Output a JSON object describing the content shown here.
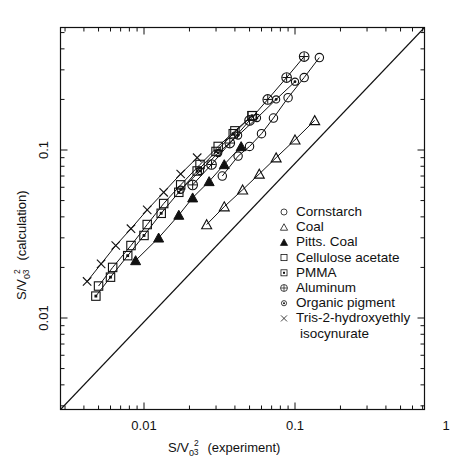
{
  "chart_data": {
    "type": "scatter",
    "title": "",
    "xlabel": "S/V0^2/3  (experiment)",
    "ylabel": "S/V0^2/3  (calculation)",
    "xlabel_parts": {
      "prefix": "S/V",
      "sub": "0",
      "sup_num": "2",
      "sup_den": "3",
      "suffix": "(experiment)"
    },
    "ylabel_parts": {
      "prefix": "S/V",
      "sub": "0",
      "sup_num": "2",
      "sup_den": "3",
      "suffix": "(calculation)"
    },
    "xscale": "log",
    "yscale": "log",
    "xlim": [
      0.003,
      1.0
    ],
    "ylim": [
      0.003,
      1.0
    ],
    "grid": false,
    "legend_position": "center-right",
    "xtick_labels": [
      {
        "value": 0.01,
        "label": "0.01"
      },
      {
        "value": 0.1,
        "label": "0.1"
      },
      {
        "value": 1,
        "label": "1"
      }
    ],
    "ytick_labels": [
      {
        "value": 0.01,
        "label": "0.01"
      },
      {
        "value": 0.1,
        "label": "0.1"
      },
      {
        "value": 1,
        "label": "1"
      }
    ],
    "reference_line": {
      "name": "one-to-one-line",
      "from": [
        0.003,
        0.003
      ],
      "to": [
        1.0,
        1.0
      ]
    },
    "series": [
      {
        "name": "Cornstarch",
        "marker": "open-circle",
        "points": [
          [
            0.033,
            0.07
          ],
          [
            0.042,
            0.092
          ],
          [
            0.05,
            0.105
          ],
          [
            0.06,
            0.125
          ],
          [
            0.072,
            0.155
          ],
          [
            0.09,
            0.205
          ],
          [
            0.115,
            0.27
          ],
          [
            0.145,
            0.355
          ]
        ]
      },
      {
        "name": "Coal",
        "marker": "open-triangle",
        "points": [
          [
            0.026,
            0.036
          ],
          [
            0.034,
            0.046
          ],
          [
            0.045,
            0.058
          ],
          [
            0.058,
            0.072
          ],
          [
            0.075,
            0.09
          ],
          [
            0.1,
            0.115
          ],
          [
            0.135,
            0.15
          ]
        ]
      },
      {
        "name": "Pitts. Coal",
        "marker": "filled-triangle",
        "points": [
          [
            0.0088,
            0.022
          ],
          [
            0.0125,
            0.03
          ],
          [
            0.017,
            0.041
          ],
          [
            0.021,
            0.052
          ],
          [
            0.027,
            0.065
          ],
          [
            0.034,
            0.082
          ],
          [
            0.044,
            0.105
          ]
        ]
      },
      {
        "name": "Cellulose acetate",
        "marker": "open-square",
        "points": [
          [
            0.005,
            0.0155
          ],
          [
            0.0062,
            0.02
          ],
          [
            0.0082,
            0.027
          ],
          [
            0.0105,
            0.036
          ],
          [
            0.0135,
            0.048
          ],
          [
            0.0175,
            0.062
          ],
          [
            0.0235,
            0.082
          ],
          [
            0.031,
            0.105
          ],
          [
            0.04,
            0.13
          ],
          [
            0.052,
            0.16
          ]
        ]
      },
      {
        "name": "PMMA",
        "marker": "dotted-square",
        "points": [
          [
            0.0048,
            0.0135
          ],
          [
            0.006,
            0.0175
          ],
          [
            0.0078,
            0.0235
          ],
          [
            0.01,
            0.031
          ],
          [
            0.013,
            0.042
          ],
          [
            0.017,
            0.056
          ],
          [
            0.0225,
            0.075
          ],
          [
            0.03,
            0.098
          ],
          [
            0.039,
            0.125
          ],
          [
            0.052,
            0.16
          ]
        ]
      },
      {
        "name": "Aluminum",
        "marker": "crossed-circle",
        "points": [
          [
            0.021,
            0.062
          ],
          [
            0.028,
            0.082
          ],
          [
            0.037,
            0.11
          ],
          [
            0.05,
            0.15
          ],
          [
            0.066,
            0.2
          ],
          [
            0.088,
            0.27
          ],
          [
            0.115,
            0.36
          ]
        ]
      },
      {
        "name": "Organic pigment",
        "marker": "dotted-circle",
        "points": [
          [
            0.0175,
            0.058
          ],
          [
            0.0235,
            0.075
          ],
          [
            0.031,
            0.096
          ],
          [
            0.042,
            0.122
          ],
          [
            0.056,
            0.155
          ],
          [
            0.075,
            0.2
          ],
          [
            0.1,
            0.255
          ]
        ]
      },
      {
        "name": "Tris-2-hydroxyethly isocynurate",
        "marker": "cross",
        "points": [
          [
            0.0042,
            0.0165
          ],
          [
            0.0052,
            0.021
          ],
          [
            0.0065,
            0.027
          ],
          [
            0.0082,
            0.034
          ],
          [
            0.0105,
            0.044
          ],
          [
            0.0135,
            0.056
          ],
          [
            0.0175,
            0.072
          ],
          [
            0.0225,
            0.09
          ]
        ]
      }
    ]
  },
  "legend": {
    "items": [
      {
        "label": "Cornstarch",
        "marker": "open-circle"
      },
      {
        "label": "Coal",
        "marker": "open-triangle"
      },
      {
        "label": "Pitts. Coal",
        "marker": "filled-triangle"
      },
      {
        "label": "Cellulose acetate",
        "marker": "open-square"
      },
      {
        "label": "PMMA",
        "marker": "dotted-square"
      },
      {
        "label": "Aluminum",
        "marker": "crossed-circle"
      },
      {
        "label": "Organic pigment",
        "marker": "dotted-circle"
      },
      {
        "label": "Tris-2-hydroxyethly",
        "marker": "cross"
      },
      {
        "label": "isocynurate",
        "marker": "none"
      }
    ]
  }
}
